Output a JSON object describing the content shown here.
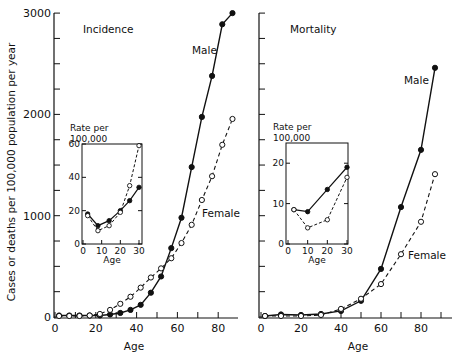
{
  "figure": {
    "ylabel": "Cases or deaths per 100,000 population per year",
    "xlabel": "Age"
  },
  "chart_data": [
    {
      "type": "line",
      "title": "Incidence",
      "xlabel": "Age",
      "ylabel": "Cases or deaths per 100,000 population per year",
      "xlim": [
        0,
        90
      ],
      "ylim": [
        0,
        3000
      ],
      "xticks": [
        0,
        20,
        40,
        60,
        80
      ],
      "yticks": [
        0,
        1000,
        2000,
        3000
      ],
      "grid": false,
      "series": [
        {
          "name": "Male",
          "style": "solid, filled circles",
          "x": [
            2,
            7,
            12,
            17,
            22,
            27,
            32,
            37,
            42,
            47,
            52,
            57,
            62,
            67,
            72,
            77,
            82,
            87
          ],
          "y": [
            15,
            15,
            15,
            15,
            15,
            25,
            40,
            70,
            120,
            240,
            400,
            680,
            980,
            1480,
            1975,
            2380,
            2890,
            3000
          ]
        },
        {
          "name": "Female",
          "style": "dashed, open circles",
          "x": [
            2,
            7,
            12,
            17,
            22,
            27,
            32,
            37,
            42,
            47,
            52,
            57,
            62,
            67,
            72,
            77,
            82,
            87
          ],
          "y": [
            10,
            10,
            10,
            15,
            30,
            70,
            130,
            200,
            290,
            390,
            480,
            580,
            730,
            910,
            1155,
            1390,
            1700,
            1955
          ]
        }
      ],
      "inset": {
        "ylabel": "Rate per 100,000",
        "xlabel": "Age",
        "xlim": [
          0,
          30
        ],
        "ylim": [
          0,
          60
        ],
        "xticks": [
          0,
          10,
          20,
          30
        ],
        "yticks": [
          0,
          20,
          40,
          60
        ],
        "series": [
          {
            "name": "Male",
            "x": [
              2.5,
              8,
              14,
              20,
              25,
              30
            ],
            "y": [
              18,
              11,
              14,
              20,
              26,
              34
            ]
          },
          {
            "name": "Female",
            "x": [
              2.5,
              8,
              14,
              20,
              25,
              30
            ],
            "y": [
              17,
              8,
              11,
              19,
              35,
              59
            ]
          }
        ]
      },
      "annotations": [
        "Male",
        "Female"
      ]
    },
    {
      "type": "line",
      "title": "Mortality",
      "xlabel": "Age",
      "ylabel": "Cases or deaths per 100,000 population per year",
      "xlim": [
        0,
        90
      ],
      "ylim": [
        0,
        3000
      ],
      "xticks": [
        0,
        20,
        40,
        60,
        80
      ],
      "yticks": [
        0,
        1000,
        2000,
        3000
      ],
      "grid": false,
      "series": [
        {
          "name": "Male",
          "style": "solid, filled circles",
          "x": [
            2,
            10,
            20,
            30,
            40,
            50,
            60,
            70,
            80,
            87
          ],
          "y": [
            10,
            25,
            20,
            30,
            60,
            160,
            475,
            1085,
            1650,
            2460
          ]
        },
        {
          "name": "Female",
          "style": "dashed, open circles",
          "x": [
            2,
            10,
            20,
            30,
            40,
            50,
            60,
            70,
            80,
            87
          ],
          "y": [
            10,
            10,
            10,
            20,
            80,
            180,
            325,
            620,
            940,
            1410
          ]
        }
      ],
      "inset": {
        "ylabel": "Rate per 100,000",
        "xlabel": "Age",
        "xlim": [
          0,
          30
        ],
        "ylim": [
          0,
          25
        ],
        "xticks": [
          0,
          10,
          20,
          30
        ],
        "yticks": [
          0,
          10,
          20
        ],
        "series": [
          {
            "name": "Male",
            "x": [
              3,
              10,
              20,
              30
            ],
            "y": [
              8.5,
              8,
              13.5,
              19
            ]
          },
          {
            "name": "Female",
            "x": [
              3,
              10,
              20,
              30
            ],
            "y": [
              8.5,
              4,
              6,
              16.5
            ]
          }
        ]
      },
      "annotations": [
        "Male",
        "Female"
      ]
    }
  ],
  "panels": {
    "left": {
      "title": "Incidence",
      "male_label": "Male",
      "female_label": "Female",
      "inset_label_line1": "Rate per",
      "inset_label_line2": "100,000",
      "inset_xlabel": "Age"
    },
    "right": {
      "title": "Mortality",
      "male_label": "Male",
      "female_label": "Female",
      "inset_label_line1": "Rate per",
      "inset_label_line2": "100,000",
      "inset_xlabel": "Age"
    }
  },
  "colors": {
    "ink": "#111111",
    "background": "#ffffff"
  }
}
